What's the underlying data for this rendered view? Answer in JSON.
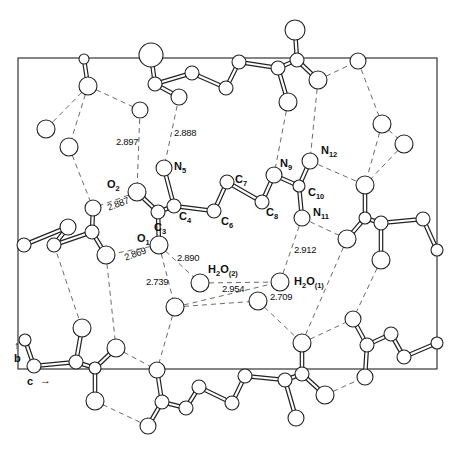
{
  "diagram": {
    "type": "crystal-packing-projection",
    "axes": {
      "b_label": "b",
      "c_label": "c",
      "b_arrow": "↑",
      "c_arrow": "→"
    },
    "cell": {
      "x": 18,
      "y": 58,
      "width": 419,
      "height": 311
    },
    "atom_labels": {
      "O1": {
        "sym": "O",
        "sub": "1"
      },
      "O2": {
        "sym": "O",
        "sub": "2"
      },
      "C3": {
        "sym": "C",
        "sub": "3"
      },
      "C4": {
        "sym": "C",
        "sub": "4"
      },
      "N5": {
        "sym": "N",
        "sub": "5"
      },
      "C6": {
        "sym": "C",
        "sub": "6"
      },
      "C7": {
        "sym": "C",
        "sub": "7"
      },
      "C8": {
        "sym": "C",
        "sub": "8"
      },
      "N9": {
        "sym": "N",
        "sub": "9"
      },
      "C10": {
        "sym": "C",
        "sub": "10"
      },
      "N11": {
        "sym": "N",
        "sub": "11"
      },
      "N12": {
        "sym": "N",
        "sub": "12"
      },
      "W2": {
        "pre": "H",
        "pre_sub": "2",
        "sym": "O",
        "sub": "(2)"
      },
      "W1": {
        "pre": "H",
        "pre_sub": "2",
        "sym": "O",
        "sub": "(1)"
      }
    },
    "distances": {
      "d2897": "2.897",
      "d2888": "2.888",
      "d2887": "2.887",
      "d2869": "2.869",
      "d2890": "2.890",
      "d2739": "2.739",
      "d2954": "2.954",
      "d2709": "2.709",
      "d2912": "2.912"
    },
    "atoms": [
      {
        "id": "O2",
        "x": 137,
        "y": 192,
        "r": 9
      },
      {
        "id": "C3",
        "x": 158,
        "y": 212,
        "r": 7
      },
      {
        "id": "C4",
        "x": 174,
        "y": 206,
        "r": 7
      },
      {
        "id": "N5",
        "x": 164,
        "y": 168,
        "r": 8
      },
      {
        "id": "O1",
        "x": 159,
        "y": 245,
        "r": 9
      },
      {
        "id": "C6",
        "x": 214,
        "y": 211,
        "r": 7
      },
      {
        "id": "C7",
        "x": 227,
        "y": 182,
        "r": 7
      },
      {
        "id": "C8",
        "x": 262,
        "y": 202,
        "r": 7
      },
      {
        "id": "N9",
        "x": 274,
        "y": 175,
        "r": 8
      },
      {
        "id": "C10",
        "x": 299,
        "y": 186,
        "r": 6
      },
      {
        "id": "N12",
        "x": 310,
        "y": 161,
        "r": 8
      },
      {
        "id": "N11",
        "x": 302,
        "y": 218,
        "r": 8
      },
      {
        "id": "W2",
        "x": 200,
        "y": 283,
        "r": 9
      },
      {
        "id": "W1",
        "x": 280,
        "y": 282,
        "r": 9
      },
      {
        "id": "a1",
        "x": 151,
        "y": 55,
        "r": 12
      },
      {
        "id": "a2",
        "x": 155,
        "y": 84,
        "r": 7
      },
      {
        "id": "a3",
        "x": 179,
        "y": 97,
        "r": 8
      },
      {
        "id": "a4",
        "x": 192,
        "y": 73,
        "r": 7
      },
      {
        "id": "a5",
        "x": 226,
        "y": 88,
        "r": 7
      },
      {
        "id": "a6",
        "x": 239,
        "y": 62,
        "r": 7
      },
      {
        "id": "a7",
        "x": 278,
        "y": 68,
        "r": 7
      },
      {
        "id": "a8",
        "x": 297,
        "y": 60,
        "r": 7
      },
      {
        "id": "a9",
        "x": 295,
        "y": 30,
        "r": 10
      },
      {
        "id": "a10",
        "x": 318,
        "y": 80,
        "r": 9
      },
      {
        "id": "a11",
        "x": 288,
        "y": 102,
        "r": 9
      },
      {
        "id": "a12",
        "x": 140,
        "y": 110,
        "r": 8
      },
      {
        "id": "a13",
        "x": 88,
        "y": 86,
        "r": 9
      },
      {
        "id": "a14",
        "x": 84,
        "y": 59,
        "r": 5
      },
      {
        "id": "a15",
        "x": 46,
        "y": 129,
        "r": 9
      },
      {
        "id": "a16",
        "x": 69,
        "y": 147,
        "r": 9
      },
      {
        "id": "a17",
        "x": 358,
        "y": 61,
        "r": 8
      },
      {
        "id": "a18",
        "x": 382,
        "y": 124,
        "r": 9
      },
      {
        "id": "a19",
        "x": 404,
        "y": 144,
        "r": 9
      },
      {
        "id": "a20",
        "x": 365,
        "y": 185,
        "r": 9
      },
      {
        "id": "a21",
        "x": 365,
        "y": 218,
        "r": 6
      },
      {
        "id": "a21b",
        "x": 381,
        "y": 223,
        "r": 7
      },
      {
        "id": "a22",
        "x": 423,
        "y": 219,
        "r": 7
      },
      {
        "id": "a23",
        "x": 437,
        "y": 250,
        "r": 6
      },
      {
        "id": "a24",
        "x": 347,
        "y": 239,
        "r": 9
      },
      {
        "id": "a25",
        "x": 381,
        "y": 260,
        "r": 9
      },
      {
        "id": "a26",
        "x": 93,
        "y": 208,
        "r": 8
      },
      {
        "id": "a27",
        "x": 92,
        "y": 232,
        "r": 7
      },
      {
        "id": "a28",
        "x": 106,
        "y": 255,
        "r": 9
      },
      {
        "id": "a29",
        "x": 68,
        "y": 227,
        "r": 8
      },
      {
        "id": "a30",
        "x": 54,
        "y": 245,
        "r": 7
      },
      {
        "id": "a31",
        "x": 24,
        "y": 245,
        "r": 7
      },
      {
        "id": "a32",
        "x": 175,
        "y": 307,
        "r": 9
      },
      {
        "id": "a33",
        "x": 82,
        "y": 328,
        "r": 9
      },
      {
        "id": "a34",
        "x": 116,
        "y": 348,
        "r": 9
      },
      {
        "id": "a35",
        "x": 25,
        "y": 340,
        "r": 6
      },
      {
        "id": "a36",
        "x": 34,
        "y": 366,
        "r": 7
      },
      {
        "id": "a37",
        "x": 76,
        "y": 362,
        "r": 7
      },
      {
        "id": "a38",
        "x": 95,
        "y": 368,
        "r": 6
      },
      {
        "id": "a39",
        "x": 95,
        "y": 401,
        "r": 9
      },
      {
        "id": "a40",
        "x": 157,
        "y": 370,
        "r": 8
      },
      {
        "id": "a41",
        "x": 162,
        "y": 402,
        "r": 7
      },
      {
        "id": "a42",
        "x": 148,
        "y": 426,
        "r": 8
      },
      {
        "id": "a43",
        "x": 186,
        "y": 408,
        "r": 7
      },
      {
        "id": "a44",
        "x": 199,
        "y": 387,
        "r": 7
      },
      {
        "id": "a45",
        "x": 232,
        "y": 403,
        "r": 7
      },
      {
        "id": "a46",
        "x": 245,
        "y": 376,
        "r": 7
      },
      {
        "id": "a47",
        "x": 285,
        "y": 380,
        "r": 7
      },
      {
        "id": "a48",
        "x": 302,
        "y": 374,
        "r": 7
      },
      {
        "id": "a49",
        "x": 296,
        "y": 418,
        "r": 8
      },
      {
        "id": "a50",
        "x": 325,
        "y": 395,
        "r": 9
      },
      {
        "id": "a51",
        "x": 302,
        "y": 343,
        "r": 9
      },
      {
        "id": "a52",
        "x": 258,
        "y": 301,
        "r": 9
      },
      {
        "id": "a53",
        "x": 353,
        "y": 319,
        "r": 8
      },
      {
        "id": "a54",
        "x": 367,
        "y": 345,
        "r": 7
      },
      {
        "id": "a55",
        "x": 391,
        "y": 334,
        "r": 7
      },
      {
        "id": "a56",
        "x": 404,
        "y": 357,
        "r": 7
      },
      {
        "id": "a57",
        "x": 437,
        "y": 343,
        "r": 6
      },
      {
        "id": "a58",
        "x": 365,
        "y": 377,
        "r": 8
      },
      {
        "id": "a59",
        "x": 377,
        "y": 260,
        "r": 0
      }
    ],
    "bonds": [
      [
        "O2",
        "C3"
      ],
      [
        "C3",
        "C4"
      ],
      [
        "C3",
        "O1"
      ],
      [
        "C4",
        "N5"
      ],
      [
        "C4",
        "C6"
      ],
      [
        "C6",
        "C7"
      ],
      [
        "C7",
        "C8"
      ],
      [
        "C8",
        "N9"
      ],
      [
        "N9",
        "C10"
      ],
      [
        "C10",
        "N12"
      ],
      [
        "C10",
        "N11"
      ],
      [
        "a1",
        "a2"
      ],
      [
        "a2",
        "a3"
      ],
      [
        "a2",
        "a4"
      ],
      [
        "a4",
        "a5"
      ],
      [
        "a5",
        "a6"
      ],
      [
        "a6",
        "a7"
      ],
      [
        "a7",
        "a8"
      ],
      [
        "a8",
        "a9"
      ],
      [
        "a8",
        "a10"
      ],
      [
        "a7",
        "a11"
      ],
      [
        "a13",
        "a14"
      ],
      [
        "a20",
        "a21"
      ],
      [
        "a21",
        "a21b"
      ],
      [
        "a21b",
        "a22"
      ],
      [
        "a22",
        "a23"
      ],
      [
        "a21",
        "a24"
      ],
      [
        "a21b",
        "a25"
      ],
      [
        "a26",
        "a27"
      ],
      [
        "a27",
        "a28"
      ],
      [
        "a27",
        "a30"
      ],
      [
        "a30",
        "a29"
      ],
      [
        "a29",
        "a31"
      ],
      [
        "a35",
        "a36"
      ],
      [
        "a36",
        "a37"
      ],
      [
        "a37",
        "a38"
      ],
      [
        "a38",
        "a34"
      ],
      [
        "a37",
        "a33"
      ],
      [
        "a38",
        "a39"
      ],
      [
        "a40",
        "a41"
      ],
      [
        "a41",
        "a42"
      ],
      [
        "a41",
        "a43"
      ],
      [
        "a43",
        "a44"
      ],
      [
        "a44",
        "a45"
      ],
      [
        "a45",
        "a46"
      ],
      [
        "a46",
        "a47"
      ],
      [
        "a47",
        "a48"
      ],
      [
        "a48",
        "a51"
      ],
      [
        "a47",
        "a49"
      ],
      [
        "a48",
        "a50"
      ],
      [
        "a53",
        "a54"
      ],
      [
        "a54",
        "a55"
      ],
      [
        "a55",
        "a56"
      ],
      [
        "a56",
        "a57"
      ],
      [
        "a54",
        "a58"
      ]
    ],
    "hbonds": [
      [
        "a13",
        "a15"
      ],
      [
        "a13",
        "a16"
      ],
      [
        "a13",
        "a12"
      ],
      [
        "a12",
        "O2"
      ],
      [
        "a3",
        "N5"
      ],
      [
        "a16",
        "a26"
      ],
      [
        "O2",
        "a26"
      ],
      [
        "O1",
        "a28"
      ],
      [
        "O1",
        "W2"
      ],
      [
        "O1",
        "a32"
      ],
      [
        "W2",
        "W1"
      ],
      [
        "a32",
        "W1"
      ],
      [
        "W1",
        "N11"
      ],
      [
        "a32",
        "a52"
      ],
      [
        "a28",
        "a34"
      ],
      [
        "a30",
        "a33"
      ],
      [
        "a32",
        "a40"
      ],
      [
        "a34",
        "a40"
      ],
      [
        "a11",
        "N9"
      ],
      [
        "a10",
        "N12"
      ],
      [
        "a10",
        "a17"
      ],
      [
        "a17",
        "a18"
      ],
      [
        "a18",
        "a19"
      ],
      [
        "a18",
        "a20"
      ],
      [
        "a19",
        "a20"
      ],
      [
        "N12",
        "a20"
      ],
      [
        "N11",
        "a24"
      ],
      [
        "a52",
        "a51"
      ],
      [
        "a51",
        "a53"
      ],
      [
        "a25",
        "a53"
      ],
      [
        "a24",
        "a51"
      ],
      [
        "a42",
        "a39"
      ],
      [
        "a50",
        "a58"
      ]
    ]
  }
}
